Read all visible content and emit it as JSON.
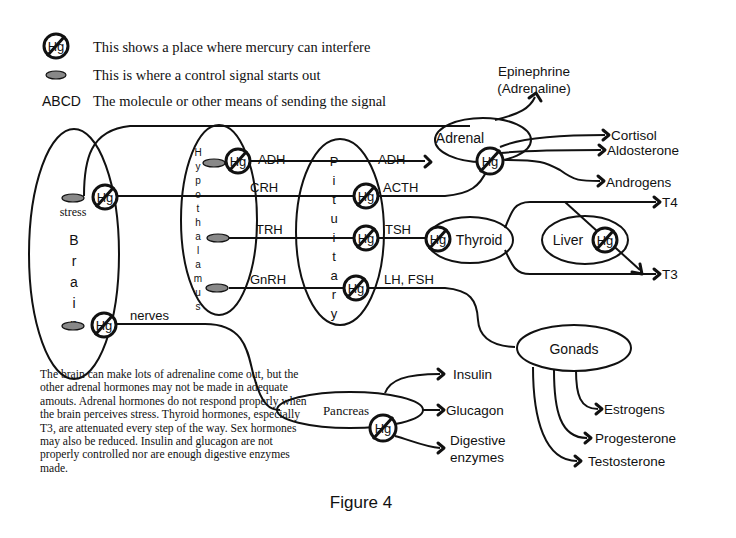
{
  "legend": {
    "hg_symbol": "Hg",
    "hg_text": "This shows a place where mercury can interfere",
    "signal_text": "This is where a control signal starts out",
    "abcd_label": "ABCD",
    "abcd_text": "The molecule or other means of sending the signal"
  },
  "organs": {
    "brain_letters": [
      "B",
      "r",
      "a",
      "i",
      "n"
    ],
    "stress": "stress",
    "hypothalamus_letters": [
      "H",
      "y",
      "p",
      "o",
      "t",
      "h",
      "a",
      "l",
      "a",
      "m",
      "u",
      "s"
    ],
    "pituitary_letters": [
      "P",
      "i",
      "t",
      "u",
      "i",
      "t",
      "a",
      "r",
      "y"
    ],
    "adrenal": "Adrenal",
    "thyroid": "Thyroid",
    "liver": "Liver",
    "gonads": "Gonads",
    "pancreas": "Pancreas"
  },
  "signals": {
    "adh_1": "ADH",
    "adh_2": "ADH",
    "crh": "CRH",
    "acth": "ACTH",
    "trh": "TRH",
    "tsh": "TSH",
    "gnrh": "GnRH",
    "lh_fsh": "LH, FSH",
    "nerves": "nerves"
  },
  "outputs": {
    "epinephrine": "Epinephrine",
    "adrenaline": "(Adrenaline)",
    "cortisol": "Cortisol",
    "aldosterone": "Aldosterone",
    "androgens": "Androgens",
    "t4": "T4",
    "t3": "T3",
    "insulin": "Insulin",
    "glucagon": "Glucagon",
    "digestive": "Digestive",
    "enzymes": "enzymes",
    "estrogens": "Estrogens",
    "progesterone": "Progesterone",
    "testosterone": "Testosterone"
  },
  "note": "The brain can make lots of adrenaline come out,  but the other adrenal hormones may not be made in adequate amouts.  Adrenal hormones do not respond properly when the brain perceives stress.  Thyroid hormones, especially T3,  are attenuated every step of the way.  Sex hormones may  also be reduced. Insulin and glucagon are not properly controlled nor are enough digestive enzymes made.",
  "caption": "Figure 4"
}
